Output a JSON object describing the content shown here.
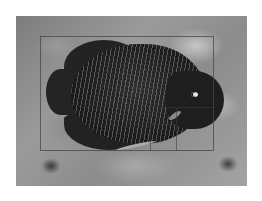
{
  "image": {
    "subject": "angelfish",
    "description": "Grayscale photograph of a dark spotted angelfish swimming over a mottled reef background, with a crop/composition overlay rectangle and golden-ratio guide lines",
    "colors": {
      "page_background": "#ffffff",
      "fish": "#1e1e1e",
      "background_mid": "#8c8c8c",
      "overlay_line": "#464646"
    },
    "overlay": {
      "type": "crop-frame-with-golden-ratio-guides",
      "frame": {
        "x": 40,
        "y": 36,
        "width": 174,
        "height": 115
      },
      "guides": [
        {
          "orientation": "vertical",
          "x": 150,
          "y_from": 107,
          "y_to": 151
        },
        {
          "orientation": "horizontal",
          "y": 107,
          "x_from": 150,
          "x_to": 214
        },
        {
          "orientation": "vertical",
          "x": 176,
          "y_from": 107,
          "y_to": 151
        },
        {
          "orientation": "horizontal",
          "y": 124,
          "x_from": 150,
          "x_to": 176
        }
      ]
    }
  }
}
